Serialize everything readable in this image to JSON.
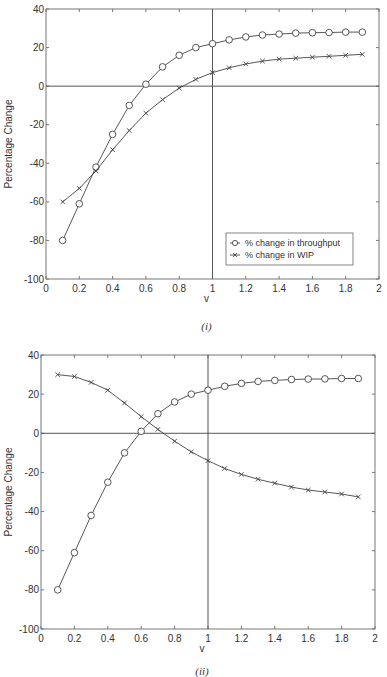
{
  "chart_data": [
    {
      "type": "line",
      "caption": "(i)",
      "title": "",
      "xlabel": "v",
      "ylabel": "Percentage Change",
      "xlim": [
        0,
        2
      ],
      "ylim": [
        -100,
        40
      ],
      "xticks": [
        0,
        0.2,
        0.4,
        0.6,
        0.8,
        1,
        1.2,
        1.4,
        1.6,
        1.8,
        2
      ],
      "xtick_labels": [
        "0",
        "0.2",
        "0.4",
        "0.6",
        "0.8",
        "1",
        "1.2",
        "1.4",
        "1.6",
        "1.8",
        "2"
      ],
      "yticks": [
        -100,
        -80,
        -60,
        -40,
        -20,
        0,
        20,
        40
      ],
      "ytick_labels": [
        "-100",
        "-80",
        "-60",
        "-40",
        "-20",
        "0",
        "20",
        "40"
      ],
      "grid": false,
      "reference_lines": {
        "horizontal": 0,
        "vertical": 1
      },
      "legend": {
        "position": "lower right",
        "entries": [
          "% change in throughput",
          "% change in WIP"
        ]
      },
      "x": [
        0.1,
        0.2,
        0.3,
        0.4,
        0.5,
        0.6,
        0.7,
        0.8,
        0.9,
        1.0,
        1.1,
        1.2,
        1.3,
        1.4,
        1.5,
        1.6,
        1.7,
        1.8,
        1.9
      ],
      "series": [
        {
          "name": "% change in throughput",
          "marker": "circle",
          "values": [
            -80,
            -61,
            -42,
            -25,
            -10,
            1,
            10,
            16,
            20,
            22,
            24,
            25.5,
            26.5,
            27,
            27.5,
            27.7,
            27.8,
            28,
            28
          ]
        },
        {
          "name": "% change in WIP",
          "marker": "x",
          "values": [
            -60,
            -53,
            -44,
            -33,
            -23,
            -14,
            -7,
            -1,
            3.5,
            7,
            9.5,
            11.5,
            13,
            14,
            14.5,
            15,
            15.5,
            16,
            16.5
          ]
        }
      ]
    },
    {
      "type": "line",
      "caption": "(ii)",
      "title": "",
      "xlabel": "v",
      "ylabel": "Percentage Change",
      "xlim": [
        0,
        2
      ],
      "ylim": [
        -100,
        40
      ],
      "xticks": [
        0,
        0.2,
        0.4,
        0.6,
        0.8,
        1,
        1.2,
        1.4,
        1.6,
        1.8,
        2
      ],
      "xtick_labels": [
        "0",
        "0.2",
        "0.4",
        "0.6",
        "0.8",
        "1",
        "1.2",
        "1.4",
        "1.6",
        "1.8",
        "2"
      ],
      "yticks": [
        -100,
        -80,
        -60,
        -40,
        -20,
        0,
        20,
        40
      ],
      "ytick_labels": [
        "-100",
        "-80",
        "-60",
        "-40",
        "-20",
        "0",
        "20",
        "40"
      ],
      "grid": false,
      "reference_lines": {
        "horizontal": 0,
        "vertical": 1
      },
      "legend": null,
      "x": [
        0.1,
        0.2,
        0.3,
        0.4,
        0.5,
        0.6,
        0.7,
        0.8,
        0.9,
        1.0,
        1.1,
        1.2,
        1.3,
        1.4,
        1.5,
        1.6,
        1.7,
        1.8,
        1.9
      ],
      "series": [
        {
          "name": "% change in throughput",
          "marker": "circle",
          "values": [
            -80,
            -61,
            -42,
            -25,
            -10,
            1,
            10,
            16,
            20,
            22,
            24,
            25.5,
            26.5,
            27,
            27.5,
            27.7,
            27.8,
            28,
            28
          ]
        },
        {
          "name": "% change in WIP",
          "marker": "x",
          "values": [
            30,
            29,
            26,
            22,
            15.5,
            8.5,
            2,
            -4,
            -9.5,
            -14,
            -18,
            -21,
            -23.5,
            -25.5,
            -27.5,
            -29,
            -30,
            -31,
            -32.5
          ]
        }
      ]
    }
  ]
}
